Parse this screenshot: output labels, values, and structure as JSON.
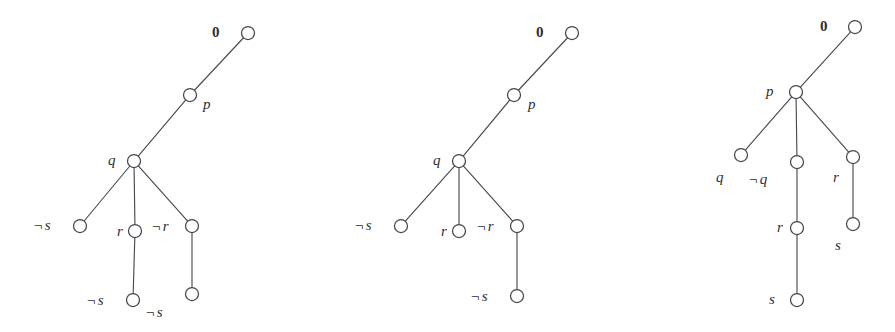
{
  "figure": {
    "background_color": "#ffffff",
    "line_color": "#4a4a52",
    "node_fill": "#ffffff",
    "node_stroke": "#45454d",
    "width": 895,
    "height": 332,
    "node_radius": 6.5
  },
  "trees": [
    {
      "id": "tree-1",
      "nodes": [
        {
          "id": "t1-n0",
          "label": "0",
          "negated": false,
          "x": 248,
          "y": 33,
          "label_x": 212,
          "label_y": 25,
          "label_align": "left",
          "is_root": true
        },
        {
          "id": "t1-n1",
          "label": "p",
          "negated": false,
          "x": 190,
          "y": 95,
          "label_x": 203,
          "label_y": 97,
          "label_align": "left",
          "is_root": false
        },
        {
          "id": "t1-n2",
          "label": "q",
          "negated": false,
          "x": 134,
          "y": 161,
          "label_x": 108,
          "label_y": 153,
          "label_align": "left",
          "is_root": false
        },
        {
          "id": "t1-n3",
          "label": "s",
          "negated": true,
          "x": 80,
          "y": 226,
          "label_x": 34,
          "label_y": 218,
          "label_align": "left",
          "is_root": false
        },
        {
          "id": "t1-n4",
          "label": "r",
          "negated": false,
          "x": 135,
          "y": 231,
          "label_x": 117,
          "label_y": 224,
          "label_align": "left",
          "is_root": false
        },
        {
          "id": "t1-n5",
          "label": "r",
          "negated": true,
          "x": 192,
          "y": 226,
          "label_x": 152,
          "label_y": 219,
          "label_align": "left",
          "is_root": false
        },
        {
          "id": "t1-n6",
          "label": "s",
          "negated": true,
          "x": 133,
          "y": 300,
          "label_x": 87,
          "label_y": 293,
          "label_align": "left",
          "is_root": false
        },
        {
          "id": "t1-n7",
          "label": "s",
          "negated": true,
          "x": 192,
          "y": 294,
          "label_x": 146,
          "label_y": 305,
          "label_align": "left",
          "is_root": false
        }
      ],
      "edges": [
        {
          "from": "t1-n0",
          "to": "t1-n1"
        },
        {
          "from": "t1-n1",
          "to": "t1-n2"
        },
        {
          "from": "t1-n2",
          "to": "t1-n3"
        },
        {
          "from": "t1-n2",
          "to": "t1-n4"
        },
        {
          "from": "t1-n2",
          "to": "t1-n5"
        },
        {
          "from": "t1-n4",
          "to": "t1-n6"
        },
        {
          "from": "t1-n5",
          "to": "t1-n7"
        }
      ]
    },
    {
      "id": "tree-2",
      "nodes": [
        {
          "id": "t2-n0",
          "label": "0",
          "negated": false,
          "x": 572,
          "y": 33,
          "label_x": 536,
          "label_y": 25,
          "label_align": "left",
          "is_root": true
        },
        {
          "id": "t2-n1",
          "label": "p",
          "negated": false,
          "x": 514,
          "y": 95,
          "label_x": 528,
          "label_y": 97,
          "label_align": "left",
          "is_root": false
        },
        {
          "id": "t2-n2",
          "label": "q",
          "negated": false,
          "x": 459,
          "y": 161,
          "label_x": 433,
          "label_y": 153,
          "label_align": "left",
          "is_root": false
        },
        {
          "id": "t2-n3",
          "label": "s",
          "negated": true,
          "x": 401,
          "y": 226,
          "label_x": 355,
          "label_y": 218,
          "label_align": "left",
          "is_root": false
        },
        {
          "id": "t2-n4",
          "label": "r",
          "negated": false,
          "x": 459,
          "y": 231,
          "label_x": 441,
          "label_y": 224,
          "label_align": "left",
          "is_root": false
        },
        {
          "id": "t2-n5",
          "label": "r",
          "negated": true,
          "x": 517,
          "y": 226,
          "label_x": 477,
          "label_y": 219,
          "label_align": "left",
          "is_root": false
        },
        {
          "id": "t2-n6",
          "label": "s",
          "negated": true,
          "x": 517,
          "y": 296,
          "label_x": 471,
          "label_y": 289,
          "label_align": "left",
          "is_root": false
        }
      ],
      "edges": [
        {
          "from": "t2-n0",
          "to": "t2-n1"
        },
        {
          "from": "t2-n1",
          "to": "t2-n2"
        },
        {
          "from": "t2-n2",
          "to": "t2-n3"
        },
        {
          "from": "t2-n2",
          "to": "t2-n4"
        },
        {
          "from": "t2-n2",
          "to": "t2-n5"
        },
        {
          "from": "t2-n5",
          "to": "t2-n6"
        }
      ]
    },
    {
      "id": "tree-3",
      "nodes": [
        {
          "id": "t3-n0",
          "label": "0",
          "negated": false,
          "x": 855,
          "y": 27,
          "label_x": 820,
          "label_y": 19,
          "label_align": "left",
          "is_root": true
        },
        {
          "id": "t3-n1",
          "label": "p",
          "negated": false,
          "x": 796,
          "y": 92,
          "label_x": 766,
          "label_y": 84,
          "label_align": "left",
          "is_root": false
        },
        {
          "id": "t3-n2",
          "label": "q",
          "negated": false,
          "x": 741,
          "y": 155,
          "label_x": 716,
          "label_y": 170,
          "label_align": "left",
          "is_root": false
        },
        {
          "id": "t3-n3",
          "label": "q",
          "negated": true,
          "x": 797,
          "y": 162,
          "label_x": 749,
          "label_y": 172,
          "label_align": "left",
          "is_root": false
        },
        {
          "id": "t3-n4",
          "label": "r",
          "negated": false,
          "x": 853,
          "y": 157,
          "label_x": 833,
          "label_y": 170,
          "label_align": "left",
          "is_root": false
        },
        {
          "id": "t3-n5",
          "label": "r",
          "negated": false,
          "x": 797,
          "y": 228,
          "label_x": 777,
          "label_y": 220,
          "label_align": "left",
          "is_root": false
        },
        {
          "id": "t3-n6",
          "label": "s",
          "negated": false,
          "x": 853,
          "y": 224,
          "label_x": 835,
          "label_y": 238,
          "label_align": "left",
          "is_root": false
        },
        {
          "id": "t3-n7",
          "label": "s",
          "negated": false,
          "x": 797,
          "y": 300,
          "label_x": 769,
          "label_y": 292,
          "label_align": "left",
          "is_root": false
        }
      ],
      "edges": [
        {
          "from": "t3-n0",
          "to": "t3-n1"
        },
        {
          "from": "t3-n1",
          "to": "t3-n2"
        },
        {
          "from": "t3-n1",
          "to": "t3-n3"
        },
        {
          "from": "t3-n1",
          "to": "t3-n4"
        },
        {
          "from": "t3-n3",
          "to": "t3-n5"
        },
        {
          "from": "t3-n4",
          "to": "t3-n6"
        },
        {
          "from": "t3-n5",
          "to": "t3-n7"
        }
      ]
    }
  ],
  "symbols": {
    "negation": "¬"
  }
}
